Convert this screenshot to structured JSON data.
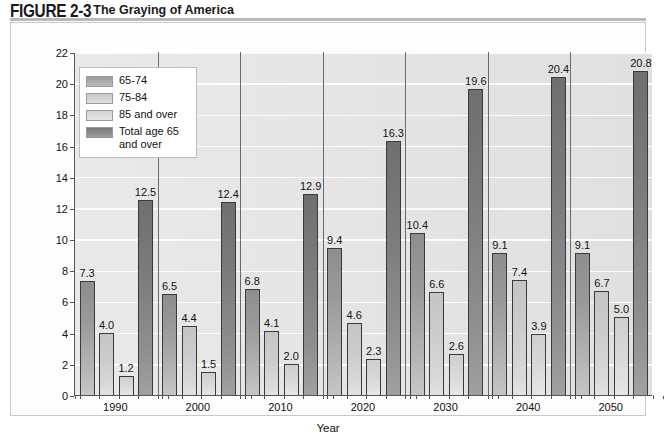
{
  "figure": {
    "label": "FIGURE 2-3",
    "title": "The Graying of America"
  },
  "chart_data": {
    "type": "bar",
    "title": "The Graying of America",
    "xlabel": "Year",
    "ylabel": "Percentage of population",
    "ylim": [
      0,
      22
    ],
    "ytick_step": 2,
    "yticks": [
      "0",
      "2",
      "4",
      "6",
      "8",
      "10",
      "12",
      "14",
      "16",
      "18",
      "20",
      "22"
    ],
    "grid": true,
    "legend_position": "top-left",
    "categories": [
      "1990",
      "2000",
      "2010",
      "2020",
      "2030",
      "2040",
      "2050"
    ],
    "series": [
      {
        "name": "65-74",
        "values": [
          7.3,
          6.5,
          6.8,
          9.4,
          10.4,
          9.1,
          9.1
        ],
        "labels": [
          "7.3",
          "6.5",
          "6.8",
          "9.4",
          "10.4",
          "9.1",
          "9.1"
        ],
        "color": "#9a9a9a"
      },
      {
        "name": "75-84",
        "values": [
          4.0,
          4.4,
          4.1,
          4.6,
          6.6,
          7.4,
          6.7
        ],
        "labels": [
          "4.0",
          "4.4",
          "4.1",
          "4.6",
          "6.6",
          "7.4",
          "6.7"
        ],
        "color": "#cccccc"
      },
      {
        "name": "85 and over",
        "values": [
          1.2,
          1.5,
          2.0,
          2.3,
          2.6,
          3.9,
          5.0
        ],
        "labels": [
          "1.2",
          "1.5",
          "2.0",
          "2.3",
          "2.6",
          "3.9",
          "5.0"
        ],
        "color": "#d8d8d8"
      },
      {
        "name": "Total age 65 and over",
        "values": [
          12.5,
          12.4,
          12.9,
          16.3,
          19.6,
          20.4,
          20.8
        ],
        "labels": [
          "12.5",
          "12.4",
          "12.9",
          "16.3",
          "19.6",
          "20.4",
          "20.8"
        ],
        "color": "#7b7b7b"
      }
    ],
    "legend": [
      "65-74",
      "75-84",
      "85 and over",
      "Total age 65 and over"
    ],
    "legend_lines": [
      [
        "65-74"
      ],
      [
        "75-84"
      ],
      [
        "85 and over"
      ],
      [
        "Total age 65",
        "and over"
      ]
    ]
  }
}
